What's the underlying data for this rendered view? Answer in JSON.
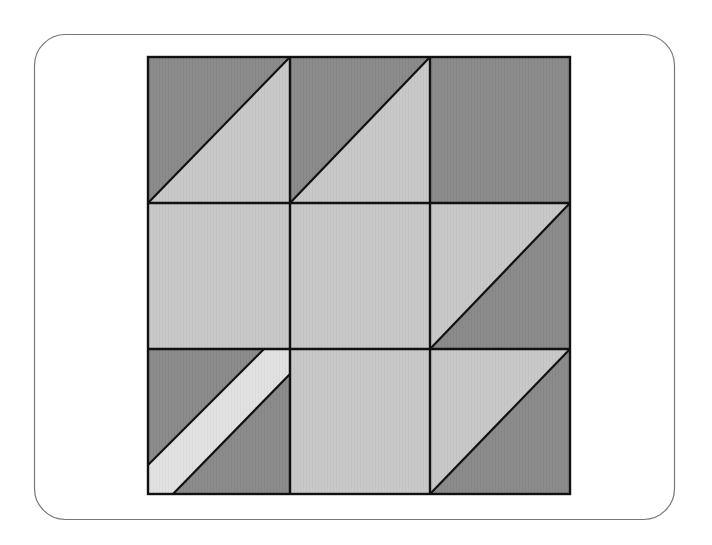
{
  "figure": {
    "type": "quilt-block-diagram",
    "rows": 3,
    "cols": 3,
    "colors": {
      "frame_stroke": "#777777",
      "dark": "#8c8c8c",
      "light": "#c8c8c8",
      "stripe": "#e2e2e2",
      "seam": "#111111",
      "background": "#ffffff"
    },
    "cells": [
      {
        "row": 0,
        "col": 0,
        "pattern": "half-square-triangle",
        "diagonal": "bl-tr",
        "upper_left": "dark",
        "lower_right": "light"
      },
      {
        "row": 0,
        "col": 1,
        "pattern": "half-square-triangle",
        "diagonal": "bl-tr",
        "upper_left": "dark",
        "lower_right": "light"
      },
      {
        "row": 0,
        "col": 2,
        "pattern": "solid",
        "fill": "dark"
      },
      {
        "row": 1,
        "col": 0,
        "pattern": "solid",
        "fill": "light"
      },
      {
        "row": 1,
        "col": 1,
        "pattern": "solid",
        "fill": "light"
      },
      {
        "row": 1,
        "col": 2,
        "pattern": "half-square-triangle",
        "diagonal": "bl-tr",
        "upper_left": "light",
        "lower_right": "dark"
      },
      {
        "row": 2,
        "col": 0,
        "pattern": "diagonal-stripe",
        "diagonal": "bl-tr",
        "fill": "dark",
        "stripe": "stripe"
      },
      {
        "row": 2,
        "col": 1,
        "pattern": "solid",
        "fill": "light"
      },
      {
        "row": 2,
        "col": 2,
        "pattern": "half-square-triangle",
        "diagonal": "bl-tr",
        "upper_left": "light",
        "lower_right": "dark"
      }
    ]
  }
}
